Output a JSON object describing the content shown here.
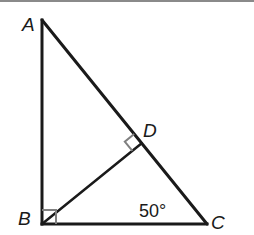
{
  "figure": {
    "type": "right-triangle-with-altitude",
    "vertices": {
      "A": {
        "label": "A",
        "x": 42,
        "y": 20
      },
      "B": {
        "label": "B",
        "x": 42,
        "y": 224
      },
      "C": {
        "label": "C",
        "x": 207,
        "y": 224
      },
      "D": {
        "label": "D",
        "x": 141.7,
        "y": 143.3
      }
    },
    "segments": [
      "AB",
      "BC",
      "AC",
      "BD"
    ],
    "right_angles": [
      "B",
      "D"
    ],
    "angle_annotation": {
      "vertex": "C",
      "text": "50°"
    },
    "colors": {
      "stroke": "#1a1a1a",
      "right_angle_marker": "#808080",
      "top_rule": "#8a8a8a"
    }
  }
}
